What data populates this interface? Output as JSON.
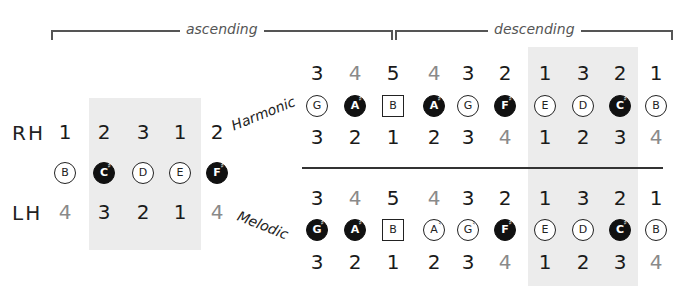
{
  "brackets": {
    "ascending": {
      "label": "ascending"
    },
    "descending": {
      "label": "descending"
    }
  },
  "left": {
    "rh_label": "RH",
    "lh_label": "LH",
    "rh_fingers": [
      {
        "v": "1",
        "gray": false
      },
      {
        "v": "2",
        "gray": false
      },
      {
        "v": "3",
        "gray": false
      },
      {
        "v": "1",
        "gray": false
      },
      {
        "v": "2",
        "gray": false
      }
    ],
    "notes": [
      {
        "name": "B",
        "acc": "",
        "style": "circle"
      },
      {
        "name": "C",
        "acc": "♯",
        "style": "dark"
      },
      {
        "name": "D",
        "acc": "",
        "style": "circle"
      },
      {
        "name": "E",
        "acc": "",
        "style": "circle"
      },
      {
        "name": "F",
        "acc": "♯",
        "style": "dark"
      }
    ],
    "lh_fingers": [
      {
        "v": "4",
        "gray": true
      },
      {
        "v": "3",
        "gray": false
      },
      {
        "v": "2",
        "gray": false
      },
      {
        "v": "1",
        "gray": false
      },
      {
        "v": "4",
        "gray": true
      }
    ]
  },
  "harmonic": {
    "label": "Harmonic",
    "rh_fingers": [
      {
        "v": "3",
        "gray": false
      },
      {
        "v": "4",
        "gray": true
      },
      {
        "v": "5",
        "gray": false
      },
      {
        "v": "4",
        "gray": true
      },
      {
        "v": "3",
        "gray": false
      },
      {
        "v": "2",
        "gray": false
      },
      {
        "v": "1",
        "gray": false
      },
      {
        "v": "3",
        "gray": false
      },
      {
        "v": "2",
        "gray": false
      },
      {
        "v": "1",
        "gray": false
      }
    ],
    "notes": [
      {
        "name": "G",
        "acc": "",
        "style": "circle"
      },
      {
        "name": "A",
        "acc": "♯",
        "style": "dark"
      },
      {
        "name": "B",
        "acc": "",
        "style": "square"
      },
      {
        "name": "A",
        "acc": "♯",
        "style": "dark"
      },
      {
        "name": "G",
        "acc": "",
        "style": "circle"
      },
      {
        "name": "F",
        "acc": "♯",
        "style": "dark"
      },
      {
        "name": "E",
        "acc": "",
        "style": "circle"
      },
      {
        "name": "D",
        "acc": "",
        "style": "circle"
      },
      {
        "name": "C",
        "acc": "♯",
        "style": "dark"
      },
      {
        "name": "B",
        "acc": "",
        "style": "circle"
      }
    ],
    "lh_fingers": [
      {
        "v": "3",
        "gray": false
      },
      {
        "v": "2",
        "gray": false
      },
      {
        "v": "1",
        "gray": false
      },
      {
        "v": "2",
        "gray": false
      },
      {
        "v": "3",
        "gray": false
      },
      {
        "v": "4",
        "gray": true
      },
      {
        "v": "1",
        "gray": false
      },
      {
        "v": "2",
        "gray": false
      },
      {
        "v": "3",
        "gray": false
      },
      {
        "v": "4",
        "gray": true
      }
    ]
  },
  "melodic": {
    "label": "Melodic",
    "rh_fingers": [
      {
        "v": "3",
        "gray": false
      },
      {
        "v": "4",
        "gray": true
      },
      {
        "v": "5",
        "gray": false
      },
      {
        "v": "4",
        "gray": true
      },
      {
        "v": "3",
        "gray": false
      },
      {
        "v": "2",
        "gray": false
      },
      {
        "v": "1",
        "gray": false
      },
      {
        "v": "3",
        "gray": false
      },
      {
        "v": "2",
        "gray": false
      },
      {
        "v": "1",
        "gray": false
      }
    ],
    "notes": [
      {
        "name": "G",
        "acc": "♯",
        "style": "dark"
      },
      {
        "name": "A",
        "acc": "♯",
        "style": "dark"
      },
      {
        "name": "B",
        "acc": "",
        "style": "square"
      },
      {
        "name": "A",
        "acc": "♮",
        "style": "circle"
      },
      {
        "name": "G",
        "acc": "♮",
        "style": "circle"
      },
      {
        "name": "F",
        "acc": "♯",
        "style": "dark"
      },
      {
        "name": "E",
        "acc": "",
        "style": "circle"
      },
      {
        "name": "D",
        "acc": "",
        "style": "circle"
      },
      {
        "name": "C",
        "acc": "♯",
        "style": "dark"
      },
      {
        "name": "B",
        "acc": "",
        "style": "circle"
      }
    ],
    "lh_fingers": [
      {
        "v": "3",
        "gray": false
      },
      {
        "v": "2",
        "gray": false
      },
      {
        "v": "1",
        "gray": false
      },
      {
        "v": "2",
        "gray": false
      },
      {
        "v": "3",
        "gray": false
      },
      {
        "v": "4",
        "gray": true
      },
      {
        "v": "1",
        "gray": false
      },
      {
        "v": "2",
        "gray": false
      },
      {
        "v": "3",
        "gray": false
      },
      {
        "v": "4",
        "gray": true
      }
    ]
  }
}
